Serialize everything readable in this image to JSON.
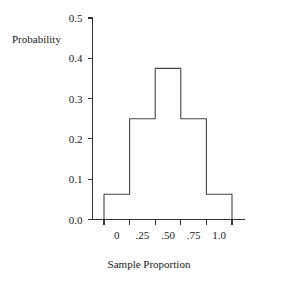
{
  "chart_data": {
    "type": "bar",
    "title": "",
    "xlabel": "Sample Proportion",
    "ylabel": "Probability",
    "categories": [
      "0",
      ".25",
      ".50",
      ".75",
      "1.0"
    ],
    "values": [
      0.0625,
      0.25,
      0.375,
      0.25,
      0.0625
    ],
    "ylim": [
      0.0,
      0.5
    ],
    "yticks": [
      "0.0",
      "0.1",
      "0.2",
      "0.3",
      "0.4",
      "0.5"
    ],
    "ytick_values": [
      0.0,
      0.1,
      0.2,
      0.3,
      0.4,
      0.5
    ],
    "xticks": [
      "0",
      ".25",
      ".50",
      ".75",
      "1.0"
    ],
    "grid": false,
    "legend": "none",
    "bar_fill": "#ffffff",
    "bar_stroke": "#444444",
    "axis_color": "#333333",
    "background": "#ffffff"
  },
  "figure": {
    "ylabel_text": "Probability",
    "xlabel_text": "Sample Proportion"
  }
}
